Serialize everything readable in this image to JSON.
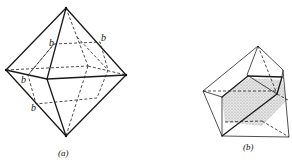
{
  "figure_a": {
    "caption": "(a)",
    "edge_label": "b",
    "labels": [
      "b",
      "b",
      "b",
      "b"
    ]
  },
  "figure_b": {
    "caption": "(b)"
  },
  "colors": {
    "line": "#1a1a1a",
    "shading": "#bdbdbd",
    "background": "#ffffff"
  }
}
